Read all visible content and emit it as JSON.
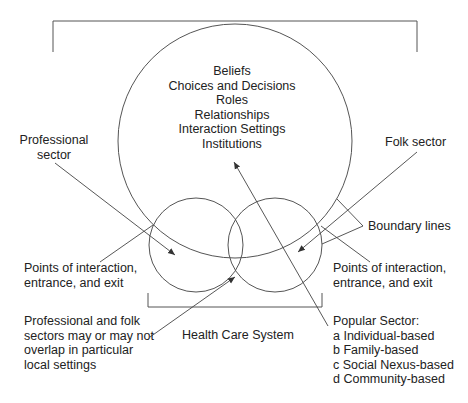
{
  "diagram": {
    "title": "Health Care System",
    "central_circle": {
      "items": [
        "Beliefs",
        "Choices and Decisions",
        "Roles",
        "Relationships",
        "Interaction Settings",
        "Institutions"
      ]
    },
    "labels": {
      "professional_sector": [
        "Professional",
        "sector"
      ],
      "folk_sector": "Folk sector",
      "boundary_lines": "Boundary lines",
      "points_left": [
        "Points of interaction,",
        "entrance, and exit"
      ],
      "points_right": [
        "Points of interaction,",
        "entrance, and exit"
      ],
      "overlap_note": [
        "Professional and folk",
        "sectors may or may not",
        "overlap in particular",
        "local settings"
      ],
      "health_care_system": "Health Care System",
      "popular_sector": {
        "heading": "Popular Sector:",
        "items": [
          "a Individual-based",
          "b Family-based",
          "c Social Nexus-based",
          "d Community-based"
        ]
      }
    },
    "colors": {
      "line": "#555555",
      "text": "#222222",
      "background": "#ffffff"
    }
  }
}
